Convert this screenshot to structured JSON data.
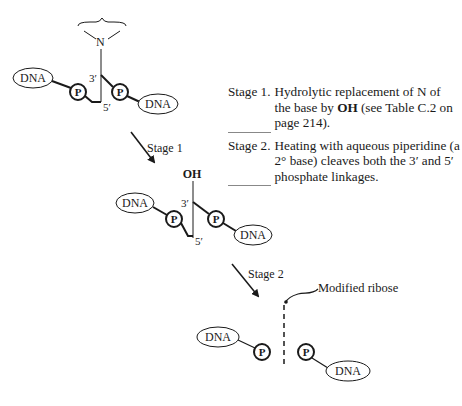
{
  "diagram": {
    "top_structure": {
      "base_atom": "N",
      "left_node": "DNA",
      "left_phosphate": "P",
      "right_phosphate": "P",
      "right_node": "DNA",
      "label_3prime": "3′",
      "label_5prime": "5′"
    },
    "arrow_stage1": {
      "label": "Stage 1"
    },
    "middle_structure": {
      "substituent": "OH",
      "left_node": "DNA",
      "left_phosphate": "P",
      "right_phosphate": "P",
      "right_node": "DNA",
      "label_3prime": "3′",
      "label_5prime": "5′"
    },
    "arrow_stage2": {
      "label": "Stage 2"
    },
    "bottom_structure": {
      "left_node": "DNA",
      "left_phosphate": "P",
      "right_phosphate": "P",
      "right_node": "DNA",
      "callout": "Modified ribose"
    }
  },
  "notes": [
    {
      "label": "Stage 1.",
      "text_before_bold": "Hydrolytic replacement of N of the base by ",
      "bold": "OH",
      "text_after_bold": " (see Table C.2 on page 214)."
    },
    {
      "label": "Stage 2.",
      "text": "Heating with aqueous piperidine (a 2° base) cleaves both the 3′ and 5′ phosphate linkages."
    }
  ]
}
